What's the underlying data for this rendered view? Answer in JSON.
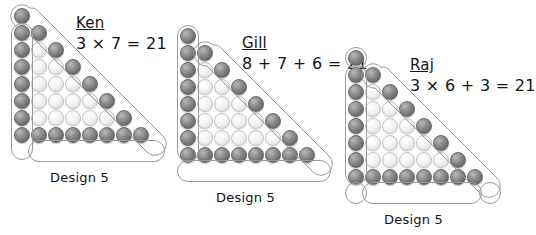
{
  "page": {
    "background_color": "#ffffff",
    "dot_dark_color": "#6e6e6e",
    "dot_light_color": "#f0f0f0",
    "outline_color": "#9a9a9a"
  },
  "figures": [
    {
      "id": "ken",
      "name": "Ken",
      "expression": "3 × 7 = 21",
      "caption": "Design 5",
      "rows": 8,
      "total_dots": 36,
      "highlighted_dots": 21,
      "grouping_description": "three groups of seven",
      "groups": [
        {
          "label": "left-column-group",
          "count": 7,
          "shape": "vertical-oval"
        },
        {
          "label": "diagonal-group",
          "count": 7,
          "shape": "diagonal-oval"
        },
        {
          "label": "bottom-row-group",
          "count": 7,
          "shape": "horizontal-oval"
        }
      ]
    },
    {
      "id": "gill",
      "name": "Gill",
      "expression": "8 + 7 + 6 = 21",
      "caption": "Design 5",
      "rows": 8,
      "total_dots": 36,
      "highlighted_dots": 21,
      "grouping_description": "eight plus seven plus six",
      "groups": [
        {
          "label": "bottom-row-group",
          "count": 8,
          "shape": "horizontal-oval"
        },
        {
          "label": "left-column-group",
          "count": 7,
          "shape": "vertical-oval"
        },
        {
          "label": "diagonal-group",
          "count": 6,
          "shape": "diagonal-oval"
        }
      ]
    },
    {
      "id": "raj",
      "name": "Raj",
      "expression": "3 × 6 + 3 = 21",
      "caption": "Design 5",
      "rows": 8,
      "total_dots": 36,
      "highlighted_dots": 21,
      "grouping_description": "three groups of six plus three corners",
      "groups": [
        {
          "label": "apex-corner-dot",
          "count": 1,
          "shape": "circle"
        },
        {
          "label": "left-column-group",
          "count": 6,
          "shape": "vertical-oval"
        },
        {
          "label": "diagonal-group",
          "count": 6,
          "shape": "diagonal-oval"
        },
        {
          "label": "bottom-row-group",
          "count": 6,
          "shape": "horizontal-oval"
        },
        {
          "label": "bottom-left-corner-dot",
          "count": 1,
          "shape": "circle"
        },
        {
          "label": "bottom-right-corner-dot",
          "count": 1,
          "shape": "circle"
        }
      ]
    }
  ]
}
